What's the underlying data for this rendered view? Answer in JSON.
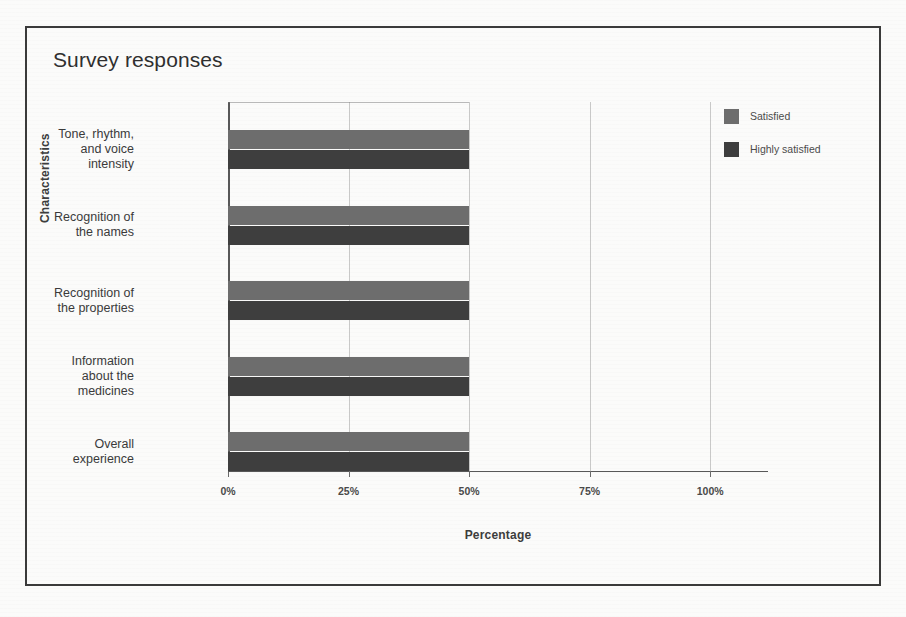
{
  "figure": {
    "title": "Survey responses"
  },
  "chart_data": {
    "type": "bar",
    "orientation": "horizontal",
    "title": "Survey responses",
    "xlabel": "Percentage",
    "ylabel": "Characteristics",
    "xlim": [
      0,
      112
    ],
    "xticks": [
      0,
      25,
      50,
      75,
      100
    ],
    "xtick_labels": [
      "0%",
      "25%",
      "50%",
      "75%",
      "100%"
    ],
    "grid": true,
    "legend_position": "right",
    "categories": [
      "Tone, rhythm,\nand voice\nintensity",
      "Recognition of\nthe names",
      "Recognition of\nthe properties",
      "Information\nabout the\nmedicines",
      "Overall\nexperience"
    ],
    "series": [
      {
        "name": "Satisfied",
        "color": "#6d6d6d",
        "values": [
          50,
          50,
          50,
          50,
          50
        ]
      },
      {
        "name": "Highly satisfied",
        "color": "#3e3e3e",
        "values": [
          50,
          50,
          50,
          50,
          50
        ]
      }
    ]
  },
  "legend": {
    "items": [
      {
        "label": "Satisfied",
        "color": "#6d6d6d"
      },
      {
        "label": "Highly satisfied",
        "color": "#3e3e3e"
      }
    ]
  }
}
